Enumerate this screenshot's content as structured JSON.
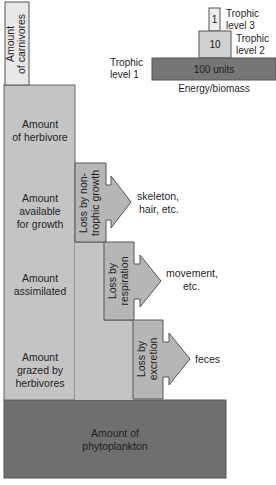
{
  "diagram": {
    "colors": {
      "carnivores": "#e8e8e8",
      "herbivore_column": "#c4c4c4",
      "loss_box": "#b6b6b6",
      "phytoplankton": "#6f6f6f",
      "trophic_level_3": "#ececec",
      "trophic_level_2": "#d0d0d0",
      "trophic_level_1": "#767676",
      "stroke": "#555555"
    },
    "main_column": {
      "carnivores_line1": "Amount",
      "carnivores_line2": "of carnivores",
      "herbivore_line1": "Amount",
      "herbivore_line2": "of herbivore",
      "growth_line1": "Amount",
      "growth_line2": "available",
      "growth_line3": "for growth",
      "assimilated_line1": "Amount",
      "assimilated_line2": "assimilated",
      "grazed_line1": "Amount",
      "grazed_line2": "grazed by",
      "grazed_line3": "herbivores",
      "phytoplankton_line1": "Amount of",
      "phytoplankton_line2": "phytoplankton"
    },
    "losses": [
      {
        "line1": "Loss by non-",
        "line2": "trophic growth",
        "out_line1": "skeleton,",
        "out_line2": "hair, etc."
      },
      {
        "line1": "Loss by",
        "line2": "respiration",
        "out_line1": "movement,",
        "out_line2": "etc."
      },
      {
        "line1": "Loss by",
        "line2": "excretion",
        "out_line1": "feces",
        "out_line2": ""
      }
    ],
    "inset_pyramid": {
      "level3": {
        "value": "1",
        "label_line1": "Trophic",
        "label_line2": "level 3"
      },
      "level2": {
        "value": "10",
        "label_line1": "Trophic",
        "label_line2": "level 2"
      },
      "level1": {
        "value": "100 units",
        "label_line1": "Trophic",
        "label_line2": "level 1"
      },
      "axis_label": "Energy/biomass"
    }
  }
}
